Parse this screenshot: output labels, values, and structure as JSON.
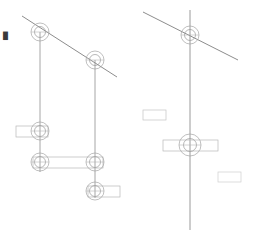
{
  "document": {
    "title": "Structural Elevation Line Drawing",
    "background_color": "#ffffff",
    "width": 258,
    "height": 243,
    "corner_mark": "█",
    "corner_mark_x": 3,
    "corner_mark_y": 33
  },
  "style": {
    "line_color": "#8a8a8a",
    "line_color_dark": "#6e6e6e",
    "line_color_light": "#b8b8b8",
    "line_color_faint": "#cfcfcf",
    "node_stroke": "#9a9a9a",
    "stroke_width": 0.7,
    "stroke_width_thin": 0.55
  },
  "views": [
    {
      "name": "left-elevation",
      "label": "Left elevation view",
      "diagonal": {
        "x1": 22,
        "y1": 16,
        "x2": 117,
        "y2": 77
      },
      "masts": [
        {
          "name": "mast-left",
          "x": 40,
          "y1": 32,
          "y2": 172
        },
        {
          "name": "mast-right",
          "x": 95,
          "y1": 58,
          "y2": 198
        }
      ],
      "nodes": [
        {
          "name": "node-top-left",
          "cx": 40,
          "cy": 32,
          "r_outer": 9,
          "r_inner": 5
        },
        {
          "name": "node-top-right",
          "cx": 95,
          "cy": 60,
          "r_outer": 9,
          "r_inner": 5
        },
        {
          "name": "node-mid-left",
          "cx": 40,
          "cy": 131,
          "r_outer": 9,
          "r_inner": 5
        },
        {
          "name": "node-lower-left",
          "cx": 40,
          "cy": 162,
          "r_outer": 9,
          "r_inner": 5
        },
        {
          "name": "node-lower-right",
          "cx": 95,
          "cy": 162,
          "r_outer": 9,
          "r_inner": 5
        },
        {
          "name": "node-bottom-right",
          "cx": 95,
          "cy": 191,
          "r_outer": 9,
          "r_inner": 5
        }
      ],
      "bars": [
        {
          "name": "crossarm-mid-left",
          "x": 16,
          "y": 126,
          "width": 32,
          "height": 11
        },
        {
          "name": "crossarm-lower-beam",
          "x": 33,
          "y": 157,
          "width": 70,
          "height": 11
        },
        {
          "name": "crossarm-bottom-right",
          "x": 88,
          "y": 186,
          "width": 32,
          "height": 11
        }
      ]
    },
    {
      "name": "right-elevation",
      "label": "Right elevation view",
      "diagonal": {
        "x1": 143,
        "y1": 12,
        "x2": 238,
        "y2": 60
      },
      "masts": [
        {
          "name": "mast-center",
          "x": 190,
          "y1": 10,
          "y2": 230
        }
      ],
      "nodes": [
        {
          "name": "node-top-center",
          "cx": 190,
          "cy": 35,
          "r_outer": 9,
          "r_inner": 5
        },
        {
          "name": "node-mid-center",
          "cx": 190,
          "cy": 145,
          "r_outer": 11,
          "r_inner": 6
        }
      ],
      "bars": [
        {
          "name": "crossarm-center",
          "x": 163,
          "y": 140,
          "width": 55,
          "height": 11
        }
      ],
      "label_boxes": [
        {
          "name": "label-box-upper",
          "x": 143,
          "y": 110,
          "width": 23,
          "height": 10
        },
        {
          "name": "label-box-lower",
          "x": 218,
          "y": 172,
          "width": 23,
          "height": 10
        }
      ]
    }
  ]
}
